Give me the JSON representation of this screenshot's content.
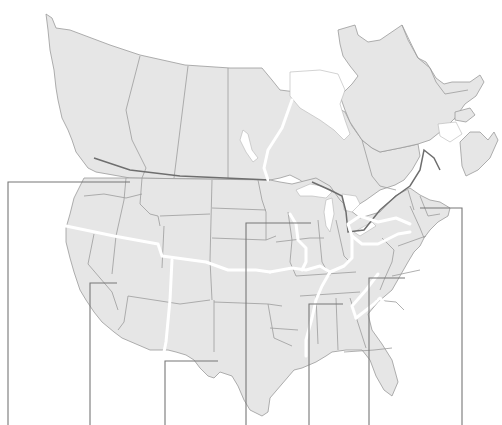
{
  "map": {
    "title": "",
    "type": "blank outline map of Canada and the United States with region boundaries and labeling leader lines",
    "colors": {
      "land": "#e6e6e6",
      "background": "#ffffff",
      "state_borders": "#9c9c9c",
      "international_border": "#6e6e6e",
      "region_dividers": "#ffffff",
      "leader_lines": "#777777"
    },
    "leader_lines": [
      {
        "id": "pacific-northwest",
        "points": [
          [
            8,
            425
          ],
          [
            8,
            182
          ],
          [
            130,
            182
          ]
        ]
      },
      {
        "id": "southwest",
        "points": [
          [
            90,
            425
          ],
          [
            90,
            283
          ],
          [
            117,
            283
          ]
        ]
      },
      {
        "id": "texas-mexico-border",
        "points": [
          [
            165,
            425
          ],
          [
            165,
            361
          ],
          [
            218,
            361
          ]
        ]
      },
      {
        "id": "great-plains",
        "points": [
          [
            246,
            425
          ],
          [
            246,
            223
          ],
          [
            311,
            223
          ]
        ]
      },
      {
        "id": "deep-south",
        "points": [
          [
            309,
            425
          ],
          [
            309,
            304
          ],
          [
            343,
            304
          ]
        ]
      },
      {
        "id": "southeast",
        "points": [
          [
            369,
            425
          ],
          [
            369,
            278
          ],
          [
            405,
            278
          ]
        ]
      },
      {
        "id": "new-england",
        "points": [
          [
            462,
            425
          ],
          [
            462,
            208
          ],
          [
            420,
            208
          ]
        ]
      }
    ],
    "labels": []
  }
}
